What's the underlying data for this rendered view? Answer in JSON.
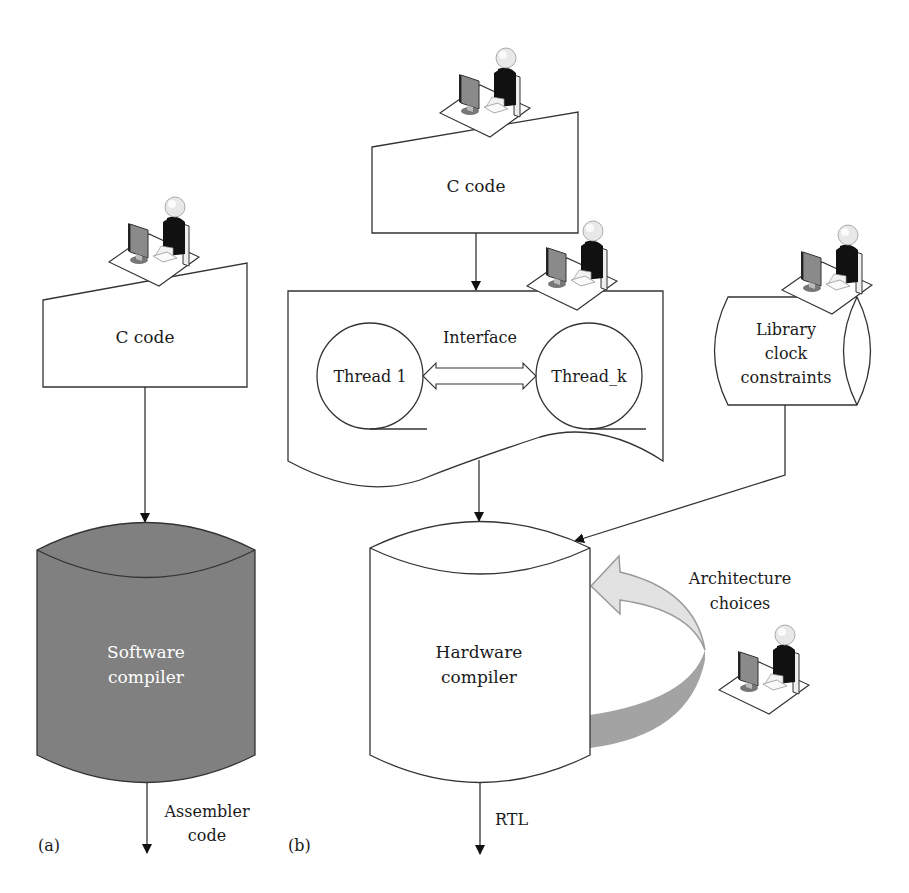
{
  "figure": {
    "panel_a": {
      "label": "(a)",
      "input_box": {
        "label": "C code",
        "shape": "manual-input"
      },
      "compiler": {
        "line1": "Software",
        "line2": "compiler",
        "fill": "#808080"
      },
      "output": {
        "line1": "Assembler",
        "line2": "code"
      }
    },
    "panel_b": {
      "label": "(b)",
      "input_box": {
        "label": "C code",
        "shape": "manual-input"
      },
      "threads_doc": {
        "interface_label": "Interface",
        "thread_1": "Thread 1",
        "thread_k": "Thread_k"
      },
      "library": {
        "line1": "Library",
        "line2": "clock",
        "line3": "constraints"
      },
      "compiler": {
        "line1": "Hardware",
        "line2": "compiler",
        "fill": "#ffffff"
      },
      "architecture": {
        "line1": "Architecture",
        "line2": "choices",
        "arrow_light": "#e2e2e2",
        "arrow_dark": "#a3a3a3"
      },
      "output": {
        "label": "RTL"
      }
    },
    "icons": [
      "operator-at-workstation-icon"
    ]
  }
}
